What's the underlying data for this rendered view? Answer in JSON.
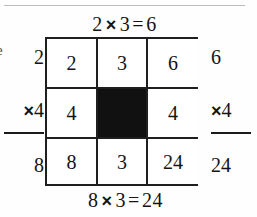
{
  "figure": {
    "edge_glyph": "e"
  },
  "equations": {
    "top": {
      "left_operand": "2",
      "times_sign": "×",
      "right_operand": "3",
      "equals_sign": "=",
      "result": "6"
    },
    "bottom": {
      "left_operand": "8",
      "times_sign": "×",
      "right_operand": "3",
      "equals_sign": "=",
      "result": "24"
    }
  },
  "side_calculations": {
    "left": {
      "top_operand": "2",
      "operator": "×",
      "multiplier": "4",
      "result": "8"
    },
    "right": {
      "top_operand": "6",
      "operator": "×",
      "multiplier": "4",
      "result": "24"
    }
  },
  "grid": {
    "cells": [
      {
        "value": "2",
        "filled": false
      },
      {
        "value": "3",
        "filled": false
      },
      {
        "value": "6",
        "filled": false
      },
      {
        "value": "4",
        "filled": false
      },
      {
        "value": "",
        "filled": true
      },
      {
        "value": "4",
        "filled": false
      },
      {
        "value": "8",
        "filled": false
      },
      {
        "value": "3",
        "filled": false
      },
      {
        "value": "24",
        "filled": false
      }
    ]
  },
  "colors": {
    "ink": "#141414",
    "rule": "#1f1f1f",
    "filled_cell": "#111111",
    "page": "#fefefe",
    "top_rule": "#bcbcbc"
  }
}
